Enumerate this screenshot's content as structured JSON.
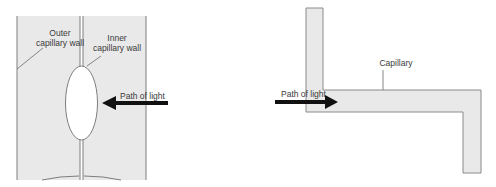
{
  "left_diagram": {
    "labels": {
      "outer_wall_line1": "Outer",
      "outer_wall_line2": "capillary wall",
      "inner_wall_line1": "Inner",
      "inner_wall_line2": "capillary wall",
      "light_path": "Path of light"
    }
  },
  "right_diagram": {
    "labels": {
      "capillary": "Capillary",
      "light_path": "Path of light"
    }
  },
  "colors": {
    "fill": "#e8e8e8",
    "stroke": "#8a8a8a",
    "arrow": "#111111"
  }
}
